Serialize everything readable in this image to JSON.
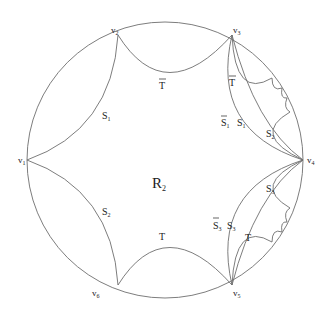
{
  "diagram": {
    "region_label": {
      "main": "R",
      "sub": "2"
    },
    "vertices": [
      {
        "id": "v1",
        "main": "v",
        "sub": "1"
      },
      {
        "id": "v2",
        "main": "v",
        "sub": "2"
      },
      {
        "id": "v3",
        "main": "v",
        "sub": "3"
      },
      {
        "id": "v4",
        "main": "v",
        "sub": "4"
      },
      {
        "id": "v5",
        "main": "v",
        "sub": "5"
      },
      {
        "id": "v6",
        "main": "v",
        "sub": "6"
      }
    ],
    "side_labels": {
      "top": {
        "main": "T",
        "bar": true
      },
      "upper_left": {
        "main": "S",
        "sub": "1"
      },
      "lower_left": {
        "main": "S",
        "sub": "2"
      },
      "bottom": {
        "main": "T"
      },
      "inner_top_right": {
        "main": "T",
        "bar": true
      },
      "inner_s1bar": {
        "main": "S",
        "sub": "1",
        "bar": true
      },
      "inner_s1": {
        "main": "S",
        "sub": "1"
      },
      "inner_s2": {
        "main": "S",
        "sub": "2"
      },
      "inner_s3": {
        "main": "S",
        "sub": "3"
      },
      "inner_s3bar_pair_bar": {
        "main": "S",
        "sub": "3",
        "bar": true
      },
      "inner_s3_pair": {
        "main": "S",
        "sub": "3"
      },
      "inner_bottom_right": {
        "main": "T"
      }
    }
  }
}
